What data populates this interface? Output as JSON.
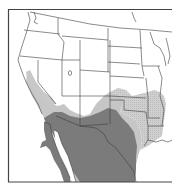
{
  "map": {
    "type": "range-map",
    "region": "Western / Southwestern United States and Northern Mexico",
    "colors": {
      "background": "#ffffff",
      "frame": "#444444",
      "borders": "#3a3a3a",
      "core_range": "#7a7a7a",
      "peripheral_range": "#c4c4c4",
      "eastern_range": "#cdcdcd"
    },
    "layers": [
      {
        "name": "core-range",
        "description": "dark gray shaded range (Mexico, Baja California, southern Arizona/New Mexico, west Texas)"
      },
      {
        "name": "peripheral-range",
        "description": "light gray shaded range (California, Nevada, Utah, Colorado, Kansas, Oklahoma, Texas)"
      },
      {
        "name": "eastern-range",
        "description": "light stippled range (Oklahoma, Arkansas, Louisiana, east Texas)"
      }
    ]
  }
}
